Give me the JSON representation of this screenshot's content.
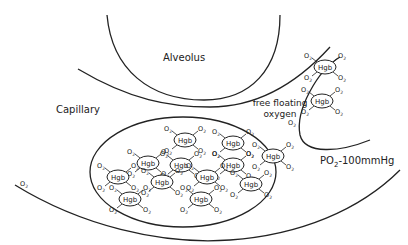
{
  "labels": {
    "alveolus": "Alveolus",
    "capillary": "Capillary",
    "free_floating_line1": "free floating",
    "free_floating_line2": "oxygen",
    "po2": "PO",
    "po2_sub": "2",
    "po2_value": "-100mmHg"
  },
  "molecule": {
    "hgb_label": "Hgb",
    "o2_label": "O",
    "o2_sub": "2"
  },
  "colors": {
    "line": "#222222",
    "background": "#ffffff",
    "accent": "#c0504d"
  },
  "red_cell_hgb": [
    {
      "x": 185,
      "y": 140
    },
    {
      "x": 233,
      "y": 143
    },
    {
      "x": 148,
      "y": 163
    },
    {
      "x": 181,
      "y": 165
    },
    {
      "x": 233,
      "y": 165
    },
    {
      "x": 273,
      "y": 156
    },
    {
      "x": 118,
      "y": 177
    },
    {
      "x": 162,
      "y": 182
    },
    {
      "x": 207,
      "y": 177
    },
    {
      "x": 251,
      "y": 184
    },
    {
      "x": 130,
      "y": 199
    },
    {
      "x": 201,
      "y": 199
    }
  ],
  "right_cell_hgb": [
    {
      "x": 325,
      "y": 67
    },
    {
      "x": 322,
      "y": 101
    }
  ],
  "free_o2": [
    {
      "x": 24,
      "y": 186
    },
    {
      "x": 292,
      "y": 125
    }
  ]
}
